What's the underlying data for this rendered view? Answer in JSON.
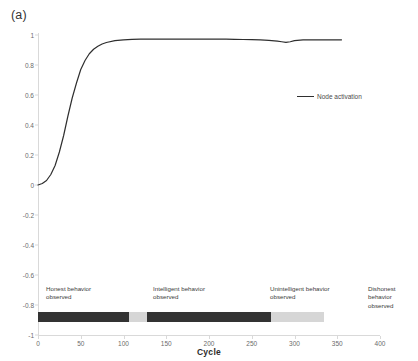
{
  "panel": {
    "label": "(a)"
  },
  "legend": {
    "position": "inside-right",
    "entries": [
      {
        "name": "Node activation",
        "color": "#2f2f2f",
        "marker": "line-segment"
      }
    ]
  },
  "phases": [
    {
      "label": "Honest behavior\nobserved",
      "start": 0,
      "end": 107,
      "color": "#333333",
      "text_x": 8
    },
    {
      "label": "Intelligent behavior\nobserved",
      "start": 107,
      "end": 127,
      "color": "#d6d6d6",
      "text_x": 115
    },
    {
      "label": "Unintelligent behavior\nobserved",
      "start": 127,
      "end": 272,
      "color": "#333333",
      "text_x": 232
    },
    {
      "label": "Dishonest behavior\nobserved",
      "start": 272,
      "end": 335,
      "color": "#d6d6d6",
      "text_x": 330
    }
  ],
  "chart_data": {
    "type": "line",
    "title": "",
    "subtitle": "",
    "xlabel": "Cycle",
    "ylabel": "",
    "xlim": [
      0,
      400
    ],
    "ylim": [
      -1,
      1
    ],
    "xticks": [
      0,
      50,
      100,
      150,
      200,
      250,
      300,
      350,
      400
    ],
    "xticklabels": [
      "0",
      "50",
      "100",
      "150",
      "200",
      "250",
      "300",
      "350",
      "400"
    ],
    "yticks": [
      1,
      0.8,
      0.6,
      0.4,
      0.2,
      0,
      -0.2,
      -0.4,
      -0.6,
      -0.8,
      -1
    ],
    "yticklabels": [
      "1",
      "0.8",
      "0.6",
      "0.4",
      "0.2",
      "0",
      "-0.2",
      "-0.4",
      "-0.6",
      "-0.8",
      "-1"
    ],
    "grid": false,
    "series": [
      {
        "name": "Node activation",
        "color": "#2f2f2f",
        "x": [
          0,
          5,
          10,
          15,
          20,
          25,
          30,
          35,
          40,
          45,
          50,
          55,
          60,
          65,
          70,
          75,
          80,
          90,
          100,
          110,
          120,
          130,
          140,
          150,
          160,
          170,
          180,
          190,
          200,
          210,
          220,
          230,
          240,
          250,
          260,
          270,
          280,
          285,
          290,
          295,
          300,
          310,
          320,
          330,
          340,
          350,
          355
        ],
        "values": [
          0.0,
          0.01,
          0.03,
          0.07,
          0.13,
          0.22,
          0.33,
          0.46,
          0.58,
          0.68,
          0.77,
          0.83,
          0.875,
          0.905,
          0.925,
          0.94,
          0.95,
          0.962,
          0.968,
          0.971,
          0.972,
          0.973,
          0.973,
          0.973,
          0.973,
          0.973,
          0.973,
          0.973,
          0.973,
          0.972,
          0.972,
          0.971,
          0.97,
          0.969,
          0.967,
          0.964,
          0.959,
          0.955,
          0.951,
          0.955,
          0.962,
          0.967,
          0.968,
          0.968,
          0.968,
          0.968,
          0.968
        ]
      }
    ]
  }
}
